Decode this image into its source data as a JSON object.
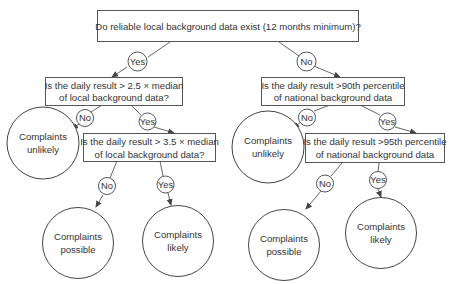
{
  "diagram": {
    "type": "decision-tree",
    "root": {
      "question": "Do reliable local background data exist (12 months minimum)?"
    },
    "left_branch": {
      "edge_label": "Yes",
      "q1": {
        "line1": "Is the daily result > 2.5 × median",
        "line2": "of local background data?"
      },
      "q1_no_label": "No",
      "q1_no_outcome": {
        "line1": "Complaints",
        "line2": "unlikely"
      },
      "q1_yes_label": "Yes",
      "q2": {
        "line1": "Is the daily result > 3.5 × median",
        "line2": "of local background data?"
      },
      "q2_no_label": "No",
      "q2_no_outcome": {
        "line1": "Complaints",
        "line2": "possible"
      },
      "q2_yes_label": "Yes",
      "q2_yes_outcome": {
        "line1": "Complaints",
        "line2": "likely"
      }
    },
    "right_branch": {
      "edge_label": "No",
      "q1": {
        "line1": "Is the daily result >90th percentile",
        "line2": "of national background data"
      },
      "q1_no_label": "No",
      "q1_no_outcome": {
        "line1": "Complaints",
        "line2": "unlikely"
      },
      "q1_yes_label": "Yes",
      "q2": {
        "line1": "Is the daily result >95th percentile",
        "line2": "of national background data"
      },
      "q2_no_label": "No",
      "q2_no_outcome": {
        "line1": "Complaints",
        "line2": "possible"
      },
      "q2_yes_label": "Yes",
      "q2_yes_outcome": {
        "line1": "Complaints",
        "line2": "likely"
      }
    },
    "colors": {
      "background": "#ffffff",
      "stroke": "#555555",
      "text": "#333333"
    }
  }
}
